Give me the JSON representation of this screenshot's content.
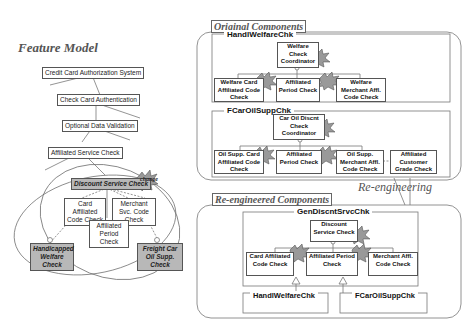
{
  "feature_model": {
    "title": "Feature Model",
    "nodes": {
      "root": "Credit Card Authorization System",
      "check_auth": "Check Card Authentication",
      "optional_validation": "Optional Data Validation",
      "affiliated_service": "Affiliated Service Check",
      "discount_service": "Discount Service Check",
      "card_affiliated": "Card Affiliated Code Check",
      "merchant_svc": "Merchant Svc. Code Check",
      "affiliated_period": "Affiliated Period Check",
      "handicapped": "Handicapped Welfare Check",
      "freight": "Freight Car Oil Supp. Check"
    },
    "change_label": "change",
    "ellipsis": "..."
  },
  "original": {
    "label": "Original Components",
    "handi": {
      "title": "HandlWelfareChk",
      "coordinator": "Welfare Check Coordinator",
      "children": [
        "Welfare Card Affiliated Code Check",
        "Affiliated Period Check",
        "Welfare Merchant Affl. Code Check"
      ]
    },
    "fcar": {
      "title": "FCarOilSuppChk",
      "coordinator": "Car Oil Discnt Check Coordinator",
      "children": [
        "Oil Supp. Card Affiliated Code Check",
        "Affiliated Period Check",
        "Oil Supp. Merchant Affl. Code Check"
      ],
      "extra": "Affiliated Customer Grade Check"
    },
    "impact_label": "impact"
  },
  "reengineering_label": "Re-engineering",
  "reengineered": {
    "label": "Re-engineered Components",
    "gen": {
      "title": "GenDiscntSrvcChk",
      "coordinator": "Discount Service Check",
      "children": [
        "Card Affiliated Code Check",
        "Affiliated Period Check",
        "Merchant Affl. Code Check"
      ]
    },
    "sub1": "HandlWelfareChk",
    "sub2": "FCarOilSuppChk"
  }
}
